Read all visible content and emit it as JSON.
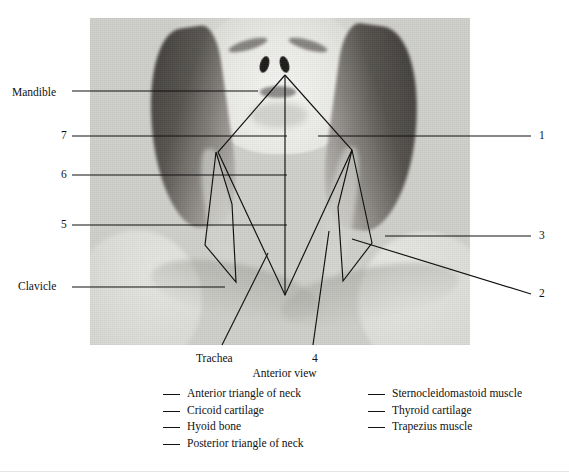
{
  "figure": {
    "caption": "Anterior view",
    "photo_alt": "anterior-view-neck-photograph"
  },
  "labels": {
    "left": [
      {
        "id": "mandible",
        "text": "Mandible",
        "x": 12,
        "y": 87,
        "anchor": "left"
      },
      {
        "id": "seven",
        "text": "7",
        "x": 61,
        "y": 132,
        "anchor": "left"
      },
      {
        "id": "six",
        "text": "6",
        "x": 61,
        "y": 171,
        "anchor": "left"
      },
      {
        "id": "five",
        "text": "5",
        "x": 61,
        "y": 221,
        "anchor": "left"
      },
      {
        "id": "clavicle",
        "text": "Clavicle",
        "x": 18,
        "y": 283,
        "anchor": "left"
      }
    ],
    "right": [
      {
        "id": "one",
        "text": "1",
        "x": 541,
        "y": 132,
        "anchor": "right"
      },
      {
        "id": "three",
        "text": "3",
        "x": 541,
        "y": 232,
        "anchor": "right"
      },
      {
        "id": "two",
        "text": "2",
        "x": 541,
        "y": 290,
        "anchor": "right"
      }
    ],
    "bottom": [
      {
        "id": "trachea",
        "text": "Trachea",
        "x": 196,
        "y": 356,
        "anchor": "bottom"
      },
      {
        "id": "four",
        "text": "4",
        "x": 312,
        "y": 356,
        "anchor": "bottom"
      }
    ]
  },
  "legend": {
    "left_column": [
      "Anterior triangle of neck",
      "Cricoid cartilage",
      "Hyoid bone",
      "Posterior triangle of neck"
    ],
    "right_column": [
      "Sternocleidomastoid muscle",
      "Thyroid cartilage",
      "Trapezius muscle"
    ]
  },
  "colors": {
    "ink": "#111111",
    "page": "#ffffff",
    "photo_tone": "#d9d9d5"
  }
}
